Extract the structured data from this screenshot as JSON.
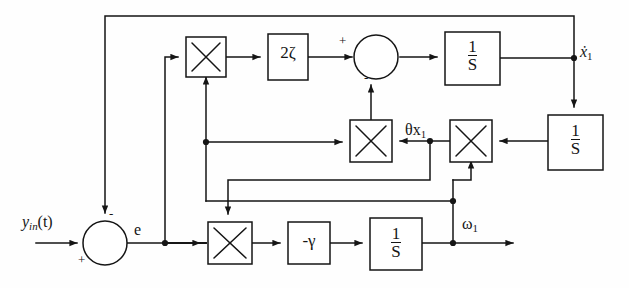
{
  "figure": {
    "type": "control-system-block-diagram",
    "background_color": "#fefefe",
    "line_color": "#151515"
  },
  "signals": {
    "input": "y",
    "input_sub": "in",
    "input_arg": "(t)",
    "error": "e",
    "xdot1": "ẋ",
    "xdot1_sub": "1",
    "theta_x1": "θx",
    "theta_x1_sub": "1",
    "omega1": "ω",
    "omega1_sub": "1"
  },
  "summers": [
    {
      "name": "input-summer",
      "plus": "+",
      "minus": "-"
    },
    {
      "name": "damping-summer",
      "plus": "+",
      "minus": "-"
    }
  ],
  "blocks": [
    {
      "name": "multiplier-damping",
      "label": "×",
      "kind": "multiplier"
    },
    {
      "name": "gain-two-zeta",
      "num": "2ζ",
      "kind": "gain"
    },
    {
      "name": "integrator-xdot",
      "num": "1",
      "den": "S",
      "kind": "integrator"
    },
    {
      "name": "integrator-x",
      "num": "1",
      "den": "S",
      "kind": "integrator"
    },
    {
      "name": "multiplier-theta-x",
      "label": "×",
      "kind": "multiplier"
    },
    {
      "name": "multiplier-theta",
      "label": "×",
      "kind": "multiplier"
    },
    {
      "name": "multiplier-adaptation",
      "label": "×",
      "kind": "multiplier"
    },
    {
      "name": "gain-neg-gamma",
      "num": "-γ",
      "kind": "gain"
    },
    {
      "name": "integrator-omega",
      "num": "1",
      "den": "S",
      "kind": "integrator"
    }
  ]
}
